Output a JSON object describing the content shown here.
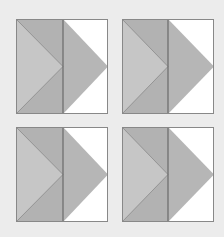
{
  "figure": {
    "background": "#ececec",
    "colors": {
      "left_panel": "#c6c6c6",
      "left_triangles": "#b2b2b2",
      "arrow": "#b6b6b6",
      "right_panel": "#ffffff",
      "outline": "#777777"
    },
    "blocks": [
      {
        "id": "top-left"
      },
      {
        "id": "top-right"
      },
      {
        "id": "bottom-left"
      },
      {
        "id": "bottom-right"
      }
    ]
  }
}
